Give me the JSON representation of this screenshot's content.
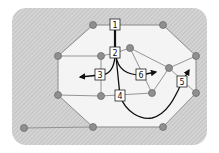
{
  "colors": {
    "background_hatch": "#c8c8c8",
    "interior": "#f2f2f2",
    "edge": "#8a8a8a",
    "node_fill": "#8f8f8f",
    "node_stroke": "#6e6e6e",
    "path": "#111111"
  },
  "nodes": [
    {
      "id": "n1",
      "x": 93,
      "y": 25
    },
    {
      "id": "n2",
      "x": 163,
      "y": 25
    },
    {
      "id": "n3",
      "x": 58,
      "y": 56
    },
    {
      "id": "n4",
      "x": 101,
      "y": 56
    },
    {
      "id": "n5",
      "x": 130,
      "y": 48
    },
    {
      "id": "n6",
      "x": 196,
      "y": 56
    },
    {
      "id": "n7",
      "x": 169,
      "y": 68
    },
    {
      "id": "n8",
      "x": 58,
      "y": 95
    },
    {
      "id": "n9",
      "x": 101,
      "y": 96
    },
    {
      "id": "n10",
      "x": 152,
      "y": 93
    },
    {
      "id": "n11",
      "x": 196,
      "y": 93
    },
    {
      "id": "n12",
      "x": 93,
      "y": 127
    },
    {
      "id": "n13",
      "x": 163,
      "y": 127
    },
    {
      "id": "n14",
      "x": 24,
      "y": 128
    }
  ],
  "labels": [
    {
      "id": "label-1",
      "text": "1",
      "x": 115,
      "y": 25
    },
    {
      "id": "label-2",
      "text": "2",
      "x": 115,
      "y": 53
    },
    {
      "id": "label-3",
      "text": "3",
      "x": 100,
      "y": 75
    },
    {
      "id": "label-4",
      "text": "4",
      "x": 120,
      "y": 96
    },
    {
      "id": "label-5",
      "text": "5",
      "x": 182,
      "y": 82
    },
    {
      "id": "label-6",
      "text": "6",
      "x": 141,
      "y": 75
    }
  ]
}
